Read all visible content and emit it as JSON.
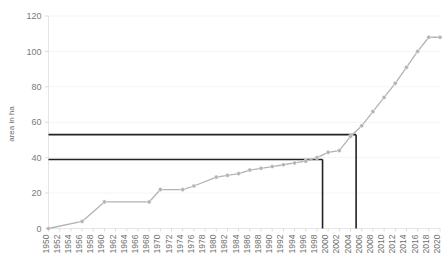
{
  "chart_data": {
    "type": "line",
    "title": "",
    "xlabel": "",
    "ylabel": "area in ha",
    "xlim": [
      1950,
      2020
    ],
    "ylim": [
      0,
      120
    ],
    "yticks": [
      0,
      20,
      40,
      60,
      80,
      100,
      120
    ],
    "xticks": [
      1950,
      1952,
      1954,
      1956,
      1958,
      1960,
      1962,
      1964,
      1966,
      1968,
      1970,
      1972,
      1974,
      1976,
      1978,
      1980,
      1982,
      1984,
      1986,
      1988,
      1990,
      1992,
      1994,
      1996,
      1998,
      2000,
      2002,
      2004,
      2006,
      2008,
      2010,
      2012,
      2014,
      2016,
      2018,
      2020
    ],
    "grid": true,
    "legend": false,
    "series": [
      {
        "name": "area",
        "marker": "circle",
        "color": "#b3b3b3",
        "x": [
          1950,
          1956,
          1960,
          1968,
          1970,
          1974,
          1976,
          1980,
          1982,
          1984,
          1986,
          1988,
          1990,
          1992,
          1994,
          1996,
          1998,
          2000,
          2002,
          2004,
          2006,
          2008,
          2010,
          2012,
          2014,
          2016,
          2018,
          2020
        ],
        "values": [
          0,
          4,
          15,
          15,
          22,
          22,
          24,
          29,
          30,
          31,
          33,
          34,
          35,
          36,
          37,
          38,
          40,
          43,
          44,
          52,
          58,
          66,
          74,
          82,
          91,
          100,
          108,
          108
        ]
      }
    ],
    "annotations": [
      {
        "name": "upper-reference-line",
        "type": "step-marker",
        "y_value": 53,
        "x_value": 2005,
        "color": "#222222"
      },
      {
        "name": "lower-reference-line",
        "type": "step-marker",
        "y_value": 39,
        "x_value": 1999,
        "color": "#222222"
      }
    ]
  },
  "axis": {
    "y_title": "area in ha",
    "y_tick_labels": [
      "0",
      "20",
      "40",
      "60",
      "80",
      "100",
      "120"
    ],
    "x_tick_labels": [
      "1950",
      "1952",
      "1954",
      "1956",
      "1958",
      "1960",
      "1962",
      "1964",
      "1966",
      "1968",
      "1970",
      "1972",
      "1974",
      "1976",
      "1978",
      "1980",
      "1982",
      "1984",
      "1986",
      "1988",
      "1990",
      "1992",
      "1994",
      "1996",
      "1998",
      "2000",
      "2002",
      "2004",
      "2006",
      "2008",
      "2010",
      "2012",
      "2014",
      "2016",
      "2018",
      "2020"
    ]
  },
  "colors": {
    "series": "#b3b3b3",
    "reference": "#222222",
    "axis": "#e2e2e2",
    "grid": "#f4f4f4",
    "tick_text": "#7a7a7a",
    "background": "#ffffff"
  }
}
